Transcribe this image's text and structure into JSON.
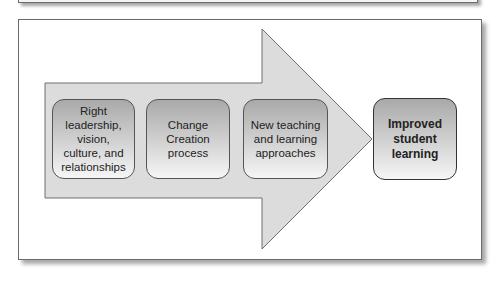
{
  "diagram": {
    "type": "process-arrow",
    "arrow_fill": "#dcdcdc",
    "steps": [
      {
        "label": "Right\nleadership,\nvision,\nculture, and\nrelationships"
      },
      {
        "label": "Change\nCreation\nprocess"
      },
      {
        "label": "New teaching\nand learning\napproaches"
      }
    ],
    "outcome": {
      "label": "Improved\nstudent\nlearning"
    }
  }
}
